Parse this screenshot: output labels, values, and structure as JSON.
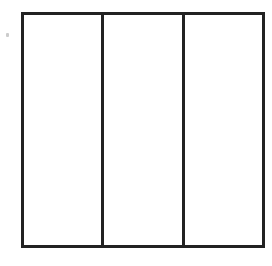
{
  "diagram": {
    "type": "rectangle divided into equal vertical parts",
    "parts": 3,
    "shaded_parts": 0,
    "colors": {
      "stroke": "#222222",
      "fill": "#ffffff"
    },
    "dividers": [
      {
        "left": 77
      },
      {
        "left": 158
      }
    ]
  }
}
